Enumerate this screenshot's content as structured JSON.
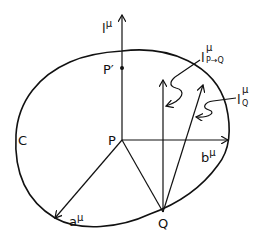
{
  "diagram": {
    "type": "vector-geometry",
    "curve_label": "C",
    "points": {
      "P": "P",
      "P_prime": "P′",
      "Q": "Q"
    },
    "vectors": {
      "l": {
        "base": "l",
        "sup": "μ"
      },
      "a": {
        "base": "a",
        "sup": "μ"
      },
      "b": {
        "base": "b",
        "sup": "μ"
      },
      "l_PQ": {
        "base": "l",
        "sup": "μ",
        "sub": "P→Q"
      },
      "l_Q": {
        "base": "l",
        "sup": "μ",
        "sub": "Q"
      }
    },
    "colors": {
      "ink": "#111111",
      "background": "#ffffff"
    }
  }
}
